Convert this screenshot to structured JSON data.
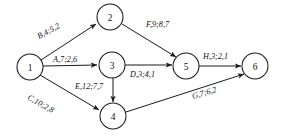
{
  "graph": {
    "type": "directed-network-diagram",
    "background_color": "#ffffff",
    "stroke_color": "#1a1a1a",
    "nodes": [
      {
        "id": "1",
        "label": "1",
        "cx": 30,
        "cy": 67,
        "r": 13
      },
      {
        "id": "2",
        "label": "2",
        "cx": 110,
        "cy": 17,
        "r": 13
      },
      {
        "id": "3",
        "label": "3",
        "cx": 112,
        "cy": 65,
        "r": 13
      },
      {
        "id": "4",
        "label": "4",
        "cx": 113,
        "cy": 116,
        "r": 13
      },
      {
        "id": "5",
        "label": "5",
        "cx": 186,
        "cy": 66,
        "r": 13
      },
      {
        "id": "6",
        "label": "6",
        "cx": 255,
        "cy": 66,
        "r": 13
      }
    ],
    "edges": [
      {
        "id": "edge-1-2",
        "from": "1",
        "to": "2",
        "label": "B,4;5,2",
        "name": "B",
        "values": [
          4,
          5,
          2
        ],
        "x1": 41,
        "y1": 60,
        "x2": 96,
        "y2": 24,
        "label_x": 39,
        "label_y": 39,
        "label_rotate": -28
      },
      {
        "id": "edge-1-3",
        "from": "1",
        "to": "3",
        "label": "A,7;2,6",
        "name": "A",
        "values": [
          7,
          2,
          6
        ],
        "x1": 43,
        "y1": 66,
        "x2": 97,
        "y2": 65,
        "label_x": 53,
        "label_y": 62,
        "label_rotate": 0
      },
      {
        "id": "edge-1-4",
        "from": "1",
        "to": "4",
        "label": "C,10;2,8",
        "name": "C",
        "values": [
          10,
          2,
          8
        ],
        "x1": 40,
        "y1": 75,
        "x2": 99,
        "y2": 110,
        "label_x": 27,
        "label_y": 99,
        "label_rotate": 29
      },
      {
        "id": "edge-2-5",
        "from": "2",
        "to": "5",
        "label": "F,9;8,7",
        "name": "F",
        "values": [
          9,
          8,
          7
        ],
        "x1": 122,
        "y1": 24,
        "x2": 176,
        "y2": 57,
        "label_x": 146,
        "label_y": 27,
        "label_rotate": 0
      },
      {
        "id": "edge-3-5",
        "from": "3",
        "to": "5",
        "label": "D,3;4,1",
        "name": "D",
        "values": [
          3,
          4,
          1
        ],
        "x1": 125,
        "y1": 65,
        "x2": 172,
        "y2": 65,
        "label_x": 130,
        "label_y": 77,
        "label_rotate": 0
      },
      {
        "id": "edge-3-4",
        "from": "3",
        "to": "4",
        "label": "E,12;7,7",
        "name": "E",
        "values": [
          12,
          7,
          7
        ],
        "x1": 113,
        "y1": 78,
        "x2": 113,
        "y2": 102,
        "label_x": 75,
        "label_y": 89,
        "label_rotate": 0
      },
      {
        "id": "edge-5-6",
        "from": "5",
        "to": "6",
        "label": "H,3;2,1",
        "name": "H",
        "values": [
          3,
          2,
          1
        ],
        "x1": 199,
        "y1": 66,
        "x2": 241,
        "y2": 66,
        "label_x": 203,
        "label_y": 59,
        "label_rotate": 0
      },
      {
        "id": "edge-4-6",
        "from": "4",
        "to": "6",
        "label": "G,7;6,2",
        "name": "G",
        "values": [
          7,
          6,
          2
        ],
        "x1": 126,
        "y1": 112,
        "x2": 244,
        "y2": 74,
        "label_x": 193,
        "label_y": 99,
        "label_rotate": -17
      }
    ]
  }
}
